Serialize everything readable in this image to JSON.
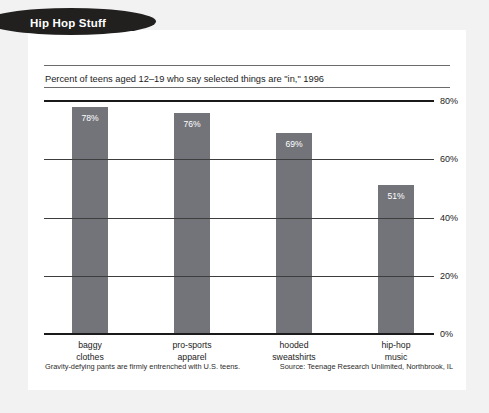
{
  "banner": {
    "label": "Hip Hop Stuff"
  },
  "chart_data": {
    "type": "bar",
    "title": "Percent of teens aged 12–19 who say selected things are \"in,\" 1996",
    "categories": [
      "baggy clothes",
      "pro-sports apparel",
      "hooded sweatshirts",
      "hip-hop music"
    ],
    "category_lines": [
      [
        "baggy",
        "clothes"
      ],
      [
        "pro-sports",
        "apparel"
      ],
      [
        "hooded",
        "sweatshirts"
      ],
      [
        "hip-hop",
        "music"
      ]
    ],
    "values": [
      78,
      76,
      69,
      51
    ],
    "value_labels": [
      "78%",
      "76%",
      "69%",
      "51%"
    ],
    "xlabel": "",
    "ylabel": "",
    "ylim": [
      0,
      80
    ],
    "yticks": [
      80,
      60,
      40,
      20,
      0
    ],
    "ytick_labels": [
      "80%",
      "60%",
      "40%",
      "20%",
      "0%"
    ],
    "grid": true,
    "legend": "none",
    "bar_color": "#73747a",
    "value_label_color": "#ffffff",
    "axis_color": "#1a1a1a",
    "gridline_color": "#3d3d3d"
  },
  "footer": {
    "caption": "Gravity-defying pants are firmly entrenched with U.S. teens.",
    "source": "Source: Teenage Research Unlimited, Northbrook, IL"
  },
  "colors": {
    "page_background": "#f2f2f2",
    "card_background": "#ffffff",
    "banner_background": "#221f1f",
    "banner_text": "#ffffff",
    "text": "#1c1c1c"
  }
}
